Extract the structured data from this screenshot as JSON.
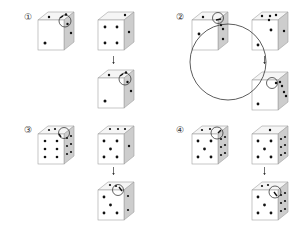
{
  "figure": {
    "panels": [
      {
        "label": "①",
        "reference_die": {
          "top": 2,
          "front": 1,
          "right": 2
        },
        "before_die": {
          "top": 1,
          "front": 4,
          "right": 1
        },
        "after_die": {
          "top": 2,
          "front": 1,
          "right": 2
        },
        "arrow": "↓"
      },
      {
        "label": "②",
        "reference_die": {
          "top": 1,
          "front": 2,
          "right": 3
        },
        "before_die": {
          "top": 4,
          "front": 2,
          "right": 1
        },
        "after_die": {
          "top": 1,
          "front": 1,
          "right": 3
        },
        "arrow": "↓",
        "large_circle": true
      },
      {
        "label": "③",
        "reference_die": {
          "top": 3,
          "front": 6,
          "right": 6
        },
        "before_die": {
          "top": 4,
          "front": 5,
          "right": 1
        },
        "after_die": {
          "top": 4,
          "front": 5,
          "right": 4
        },
        "arrow": "↓"
      },
      {
        "label": "④",
        "reference_die": {
          "top": 3,
          "front": 5,
          "right": 6
        },
        "before_die": {
          "top": 1,
          "front": 5,
          "right": 6
        },
        "after_die": {
          "top": 3,
          "front": 5,
          "right": 6
        },
        "arrow": "↓"
      }
    ],
    "colors": {
      "face_front": "#ffffff",
      "face_top": "#f4f4f4",
      "face_right": "#cfcfcf",
      "outline": "#9a9a9a",
      "pip": "#111111",
      "circle": "#222222"
    }
  }
}
